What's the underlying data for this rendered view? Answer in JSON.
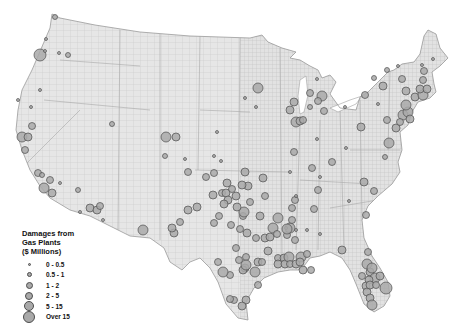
{
  "legend": {
    "title_lines": [
      "Damages from",
      "Gas Plants",
      "($ Millions)"
    ],
    "classes": [
      {
        "label": "0 - 0.5",
        "size": 3
      },
      {
        "label": "0.5 - 1",
        "size": 5
      },
      {
        "label": "1 - 2",
        "size": 7
      },
      {
        "label": "2 - 5",
        "size": 8
      },
      {
        "label": "5 - 15",
        "size": 10
      },
      {
        "label": "Over 15",
        "size": 12
      }
    ]
  },
  "colors": {
    "land": "#e6e6e6",
    "county_lines": "#bdbdbd",
    "outline": "#9a9a9a",
    "bubble_fill": "#a9a9a9",
    "bubble_stroke": "#4d4d4d"
  },
  "plants": [
    {
      "region": "WA",
      "x": 55,
      "y": 17,
      "c": 1
    },
    {
      "region": "OR",
      "x": 40,
      "y": 55,
      "c": 5
    },
    {
      "region": "OR",
      "x": 45,
      "y": 51,
      "c": 0
    },
    {
      "region": "OR",
      "x": 59,
      "y": 53,
      "c": 0
    },
    {
      "region": "OR",
      "x": 68,
      "y": 55,
      "c": 1
    },
    {
      "region": "OR",
      "x": 46,
      "y": 39,
      "c": 0
    },
    {
      "region": "CA",
      "x": 40,
      "y": 90,
      "c": 0
    },
    {
      "region": "CA",
      "x": 18,
      "y": 100,
      "c": 0
    },
    {
      "region": "CA",
      "x": 31,
      "y": 107,
      "c": 0
    },
    {
      "region": "CA",
      "x": 32,
      "y": 126,
      "c": 2
    },
    {
      "region": "CA",
      "x": 22,
      "y": 137,
      "c": 4
    },
    {
      "region": "CA",
      "x": 28,
      "y": 137,
      "c": 3
    },
    {
      "region": "CA",
      "x": 25,
      "y": 150,
      "c": 2
    },
    {
      "region": "CA",
      "x": 38,
      "y": 173,
      "c": 2
    },
    {
      "region": "CA",
      "x": 42,
      "y": 175,
      "c": 1
    },
    {
      "region": "CA",
      "x": 44,
      "y": 188,
      "c": 4
    },
    {
      "region": "CA",
      "x": 52,
      "y": 193,
      "c": 3
    },
    {
      "region": "CA",
      "x": 50,
      "y": 180,
      "c": 2
    },
    {
      "region": "NV",
      "x": 78,
      "y": 190,
      "c": 1
    },
    {
      "region": "AZ",
      "x": 90,
      "y": 208,
      "c": 3
    },
    {
      "region": "AZ",
      "x": 97,
      "y": 210,
      "c": 3
    },
    {
      "region": "AZ",
      "x": 100,
      "y": 206,
      "c": 2
    },
    {
      "region": "AZ",
      "x": 80,
      "y": 212,
      "c": 0
    },
    {
      "region": "AZ",
      "x": 103,
      "y": 220,
      "c": 0
    },
    {
      "region": "UT",
      "x": 112,
      "y": 124,
      "c": 1
    },
    {
      "region": "NV",
      "x": 60,
      "y": 183,
      "c": 0
    },
    {
      "region": "CO",
      "x": 166,
      "y": 137,
      "c": 4
    },
    {
      "region": "CO",
      "x": 176,
      "y": 137,
      "c": 3
    },
    {
      "region": "CO",
      "x": 165,
      "y": 156,
      "c": 1
    },
    {
      "region": "KS",
      "x": 217,
      "y": 132,
      "c": 0
    },
    {
      "region": "NM",
      "x": 143,
      "y": 230,
      "c": 4
    },
    {
      "region": "TX",
      "x": 188,
      "y": 210,
      "c": 3
    },
    {
      "region": "TX",
      "x": 214,
      "y": 223,
      "c": 2
    },
    {
      "region": "TX",
      "x": 219,
      "y": 216,
      "c": 2
    },
    {
      "region": "TX",
      "x": 222,
      "y": 193,
      "c": 2
    },
    {
      "region": "TX",
      "x": 231,
      "y": 225,
      "c": 2
    },
    {
      "region": "TX",
      "x": 243,
      "y": 216,
      "c": 2
    },
    {
      "region": "TX",
      "x": 244,
      "y": 212,
      "c": 4
    },
    {
      "region": "TX",
      "x": 250,
      "y": 202,
      "c": 2
    },
    {
      "region": "TX",
      "x": 260,
      "y": 216,
      "c": 3
    },
    {
      "region": "TX",
      "x": 247,
      "y": 233,
      "c": 3
    },
    {
      "region": "TX",
      "x": 256,
      "y": 238,
      "c": 2
    },
    {
      "region": "TX",
      "x": 265,
      "y": 238,
      "c": 3
    },
    {
      "region": "TX",
      "x": 270,
      "y": 237,
      "c": 3
    },
    {
      "region": "TX",
      "x": 278,
      "y": 218,
      "c": 4
    },
    {
      "region": "TX",
      "x": 287,
      "y": 235,
      "c": 2
    },
    {
      "region": "TX",
      "x": 290,
      "y": 228,
      "c": 4
    },
    {
      "region": "TX",
      "x": 292,
      "y": 220,
      "c": 2
    },
    {
      "region": "TX",
      "x": 239,
      "y": 260,
      "c": 2
    },
    {
      "region": "TX",
      "x": 245,
      "y": 268,
      "c": 3
    },
    {
      "region": "TX",
      "x": 246,
      "y": 257,
      "c": 2
    },
    {
      "region": "TX",
      "x": 258,
      "y": 262,
      "c": 3
    },
    {
      "region": "TX",
      "x": 262,
      "y": 262,
      "c": 2
    },
    {
      "region": "TX",
      "x": 268,
      "y": 251,
      "c": 3
    },
    {
      "region": "TX",
      "x": 278,
      "y": 258,
      "c": 2
    },
    {
      "region": "TX",
      "x": 284,
      "y": 258,
      "c": 3
    },
    {
      "region": "TX",
      "x": 278,
      "y": 264,
      "c": 3
    },
    {
      "region": "TX",
      "x": 243,
      "y": 270,
      "c": 3
    },
    {
      "region": "TX",
      "x": 246,
      "y": 265,
      "c": 4
    },
    {
      "region": "TX",
      "x": 285,
      "y": 264,
      "c": 3
    },
    {
      "region": "TX",
      "x": 289,
      "y": 257,
      "c": 4
    },
    {
      "region": "TX",
      "x": 290,
      "y": 264,
      "c": 2
    },
    {
      "region": "TX",
      "x": 296,
      "y": 264,
      "c": 3
    },
    {
      "region": "TX",
      "x": 301,
      "y": 257,
      "c": 4
    },
    {
      "region": "TX",
      "x": 300,
      "y": 262,
      "c": 3
    },
    {
      "region": "TX",
      "x": 307,
      "y": 254,
      "c": 2
    },
    {
      "region": "TX",
      "x": 303,
      "y": 270,
      "c": 3
    },
    {
      "region": "TX",
      "x": 311,
      "y": 270,
      "c": 2
    },
    {
      "region": "TX",
      "x": 230,
      "y": 275,
      "c": 2
    },
    {
      "region": "TX",
      "x": 223,
      "y": 272,
      "c": 4
    },
    {
      "region": "TX",
      "x": 255,
      "y": 272,
      "c": 4
    },
    {
      "region": "TX",
      "x": 258,
      "y": 285,
      "c": 2
    },
    {
      "region": "TX",
      "x": 246,
      "y": 300,
      "c": 3
    },
    {
      "region": "TX",
      "x": 234,
      "y": 300,
      "c": 2
    },
    {
      "region": "TX",
      "x": 230,
      "y": 299,
      "c": 2
    },
    {
      "region": "TX",
      "x": 242,
      "y": 306,
      "c": 3
    },
    {
      "region": "TX",
      "x": 218,
      "y": 262,
      "c": 2
    },
    {
      "region": "TX",
      "x": 236,
      "y": 248,
      "c": 2
    },
    {
      "region": "OK",
      "x": 226,
      "y": 193,
      "c": 3
    },
    {
      "region": "OK",
      "x": 228,
      "y": 200,
      "c": 3
    },
    {
      "region": "OK",
      "x": 236,
      "y": 196,
      "c": 3
    },
    {
      "region": "OK",
      "x": 237,
      "y": 207,
      "c": 3
    },
    {
      "region": "OK",
      "x": 224,
      "y": 204,
      "c": 3
    },
    {
      "region": "OK",
      "x": 232,
      "y": 189,
      "c": 2
    },
    {
      "region": "OK",
      "x": 245,
      "y": 172,
      "c": 3
    },
    {
      "region": "OK",
      "x": 248,
      "y": 186,
      "c": 3
    },
    {
      "region": "OK",
      "x": 242,
      "y": 185,
      "c": 3
    },
    {
      "region": "AR",
      "x": 265,
      "y": 196,
      "c": 2
    },
    {
      "region": "AR",
      "x": 263,
      "y": 178,
      "c": 3
    },
    {
      "region": "KS",
      "x": 227,
      "y": 183,
      "c": 3
    },
    {
      "region": "KS",
      "x": 213,
      "y": 195,
      "c": 3
    },
    {
      "region": "KS",
      "x": 214,
      "y": 173,
      "c": 2
    },
    {
      "region": "KS",
      "x": 197,
      "y": 207,
      "c": 3
    },
    {
      "region": "MO",
      "x": 273,
      "y": 228,
      "c": 4
    },
    {
      "region": "LA",
      "x": 296,
      "y": 230,
      "c": 0
    },
    {
      "region": "LA",
      "x": 277,
      "y": 234,
      "c": 2
    },
    {
      "region": "LA",
      "x": 240,
      "y": 229,
      "c": 2
    },
    {
      "region": "NM",
      "x": 174,
      "y": 233,
      "c": 3
    },
    {
      "region": "NM",
      "x": 172,
      "y": 228,
      "c": 3
    },
    {
      "region": "NM",
      "x": 180,
      "y": 222,
      "c": 2
    },
    {
      "region": "NM",
      "x": 206,
      "y": 177,
      "c": 2
    },
    {
      "region": "CO",
      "x": 188,
      "y": 172,
      "c": 2
    },
    {
      "region": "CO",
      "x": 185,
      "y": 159,
      "c": 0
    },
    {
      "region": "NE",
      "x": 214,
      "y": 156,
      "c": 0
    },
    {
      "region": "NE",
      "x": 221,
      "y": 161,
      "c": 0
    },
    {
      "region": "MN",
      "x": 258,
      "y": 88,
      "c": 4
    },
    {
      "region": "MN",
      "x": 245,
      "y": 98,
      "c": 0
    },
    {
      "region": "IA",
      "x": 256,
      "y": 107,
      "c": 0
    },
    {
      "region": "WI",
      "x": 294,
      "y": 102,
      "c": 3
    },
    {
      "region": "WI",
      "x": 290,
      "y": 110,
      "c": 3
    },
    {
      "region": "IL",
      "x": 296,
      "y": 122,
      "c": 4
    },
    {
      "region": "IL",
      "x": 300,
      "y": 121,
      "c": 3
    },
    {
      "region": "IL",
      "x": 303,
      "y": 120,
      "c": 2
    },
    {
      "region": "MI",
      "x": 322,
      "y": 96,
      "c": 4
    },
    {
      "region": "MI",
      "x": 318,
      "y": 101,
      "c": 2
    },
    {
      "region": "MI",
      "x": 324,
      "y": 111,
      "c": 2
    },
    {
      "region": "MI",
      "x": 310,
      "y": 93,
      "c": 2
    },
    {
      "region": "MI",
      "x": 310,
      "y": 107,
      "c": 1
    },
    {
      "region": "MI",
      "x": 317,
      "y": 79,
      "c": 0
    },
    {
      "region": "OH",
      "x": 361,
      "y": 127,
      "c": 3
    },
    {
      "region": "OH",
      "x": 345,
      "y": 107,
      "c": 0
    },
    {
      "region": "IN",
      "x": 317,
      "y": 139,
      "c": 0
    },
    {
      "region": "IN",
      "x": 294,
      "y": 152,
      "c": 2
    },
    {
      "region": "KY",
      "x": 332,
      "y": 162,
      "c": 2
    },
    {
      "region": "KY",
      "x": 346,
      "y": 148,
      "c": 0
    },
    {
      "region": "PA",
      "x": 387,
      "y": 120,
      "c": 2
    },
    {
      "region": "PA",
      "x": 378,
      "y": 104,
      "c": 0
    },
    {
      "region": "PA",
      "x": 365,
      "y": 95,
      "c": 2
    },
    {
      "region": "NY",
      "x": 374,
      "y": 78,
      "c": 1
    },
    {
      "region": "NY",
      "x": 383,
      "y": 86,
      "c": 3
    },
    {
      "region": "NY",
      "x": 402,
      "y": 79,
      "c": 2
    },
    {
      "region": "NY",
      "x": 406,
      "y": 91,
      "c": 3
    },
    {
      "region": "NJ",
      "x": 403,
      "y": 115,
      "c": 4
    },
    {
      "region": "NJ",
      "x": 408,
      "y": 112,
      "c": 4
    },
    {
      "region": "NJ",
      "x": 406,
      "y": 105,
      "c": 4
    },
    {
      "region": "NJ",
      "x": 410,
      "y": 119,
      "c": 3
    },
    {
      "region": "NJ",
      "x": 396,
      "y": 128,
      "c": 3
    },
    {
      "region": "NJ",
      "x": 400,
      "y": 122,
      "c": 2
    },
    {
      "region": "MD",
      "x": 389,
      "y": 143,
      "c": 4
    },
    {
      "region": "VA",
      "x": 385,
      "y": 157,
      "c": 1
    },
    {
      "region": "CT",
      "x": 415,
      "y": 97,
      "c": 3
    },
    {
      "region": "MA",
      "x": 423,
      "y": 95,
      "c": 4
    },
    {
      "region": "MA",
      "x": 420,
      "y": 89,
      "c": 3
    },
    {
      "region": "MA",
      "x": 427,
      "y": 89,
      "c": 3
    },
    {
      "region": "MA",
      "x": 423,
      "y": 80,
      "c": 2
    },
    {
      "region": "NH",
      "x": 424,
      "y": 71,
      "c": 2
    },
    {
      "region": "ME",
      "x": 433,
      "y": 59,
      "c": 0
    },
    {
      "region": "ME",
      "x": 422,
      "y": 65,
      "c": 0
    },
    {
      "region": "NY",
      "x": 398,
      "y": 66,
      "c": 0
    },
    {
      "region": "NY",
      "x": 387,
      "y": 70,
      "c": 1
    },
    {
      "region": "NC",
      "x": 364,
      "y": 182,
      "c": 3
    },
    {
      "region": "NC",
      "x": 374,
      "y": 191,
      "c": 2
    },
    {
      "region": "NC",
      "x": 349,
      "y": 201,
      "c": 0
    },
    {
      "region": "GA",
      "x": 286,
      "y": 228,
      "c": 0
    },
    {
      "region": "AL",
      "x": 295,
      "y": 200,
      "c": 2
    },
    {
      "region": "AL",
      "x": 292,
      "y": 208,
      "c": 2
    },
    {
      "region": "GA",
      "x": 287,
      "y": 229,
      "c": 4
    },
    {
      "region": "MS",
      "x": 295,
      "y": 240,
      "c": 2
    },
    {
      "region": "FL",
      "x": 342,
      "y": 250,
      "c": 3
    },
    {
      "region": "FL",
      "x": 368,
      "y": 252,
      "c": 2
    },
    {
      "region": "FL",
      "x": 367,
      "y": 264,
      "c": 4
    },
    {
      "region": "FL",
      "x": 370,
      "y": 272,
      "c": 3
    },
    {
      "region": "FL",
      "x": 372,
      "y": 268,
      "c": 4
    },
    {
      "region": "FL",
      "x": 375,
      "y": 278,
      "c": 4
    },
    {
      "region": "FL",
      "x": 369,
      "y": 280,
      "c": 3
    },
    {
      "region": "FL",
      "x": 366,
      "y": 286,
      "c": 3
    },
    {
      "region": "FL",
      "x": 367,
      "y": 292,
      "c": 3
    },
    {
      "region": "FL",
      "x": 362,
      "y": 276,
      "c": 2
    },
    {
      "region": "FL",
      "x": 370,
      "y": 285,
      "c": 3
    },
    {
      "region": "FL",
      "x": 376,
      "y": 285,
      "c": 2
    },
    {
      "region": "FL",
      "x": 370,
      "y": 298,
      "c": 3
    },
    {
      "region": "FL",
      "x": 386,
      "y": 288,
      "c": 5
    },
    {
      "region": "FL",
      "x": 380,
      "y": 276,
      "c": 3
    },
    {
      "region": "FL",
      "x": 372,
      "y": 305,
      "c": 4
    },
    {
      "region": "SC",
      "x": 366,
      "y": 215,
      "c": 2
    },
    {
      "region": "GA",
      "x": 314,
      "y": 209,
      "c": 2
    },
    {
      "region": "TN",
      "x": 318,
      "y": 190,
      "c": 2
    },
    {
      "region": "TN",
      "x": 320,
      "y": 177,
      "c": 0
    },
    {
      "region": "KY",
      "x": 312,
      "y": 168,
      "c": 2
    },
    {
      "region": "MO",
      "x": 290,
      "y": 172,
      "c": 0
    },
    {
      "region": "AR",
      "x": 296,
      "y": 196,
      "c": 0
    },
    {
      "region": "MS",
      "x": 307,
      "y": 230,
      "c": 0
    },
    {
      "region": "LA",
      "x": 320,
      "y": 234,
      "c": 0
    }
  ]
}
